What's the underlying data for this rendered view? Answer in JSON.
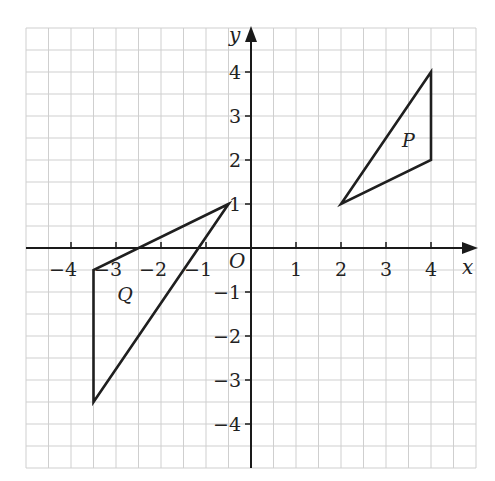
{
  "diagram": {
    "type": "coordinate-grid",
    "axes": {
      "x_label": "x",
      "y_label": "y",
      "origin_label": "O",
      "x_range": [
        -5,
        5
      ],
      "y_range": [
        -5,
        5
      ],
      "grid_step": 0.5,
      "x_ticks": [
        {
          "value": -4,
          "label": "−4"
        },
        {
          "value": -3,
          "label": "−3"
        },
        {
          "value": -2,
          "label": "−2"
        },
        {
          "value": -1,
          "label": "−1"
        },
        {
          "value": 1,
          "label": "1"
        },
        {
          "value": 2,
          "label": "2"
        },
        {
          "value": 3,
          "label": "3"
        },
        {
          "value": 4,
          "label": "4"
        }
      ],
      "y_ticks": [
        {
          "value": 4,
          "label": "4"
        },
        {
          "value": 3,
          "label": "3"
        },
        {
          "value": 2,
          "label": "2"
        },
        {
          "value": 1,
          "label": "1"
        },
        {
          "value": -1,
          "label": "−1"
        },
        {
          "value": -2,
          "label": "−2"
        },
        {
          "value": -3,
          "label": "−3"
        },
        {
          "value": -4,
          "label": "−4"
        }
      ]
    },
    "shapes": [
      {
        "name": "P",
        "label": "P",
        "vertices": [
          [
            2,
            1
          ],
          [
            4,
            4
          ],
          [
            4,
            2
          ]
        ],
        "label_pos": [
          3.5,
          2.3
        ]
      },
      {
        "name": "Q",
        "label": "Q",
        "vertices": [
          [
            -0.5,
            1
          ],
          [
            -3.5,
            -0.5
          ],
          [
            -3.5,
            -3.5
          ]
        ],
        "label_pos": [
          -2.8,
          -1.2
        ]
      }
    ],
    "colors": {
      "grid": "#cfcfcf",
      "axis": "#1a1a1a",
      "shape": "#1f1f1f",
      "background": "#ffffff"
    }
  }
}
